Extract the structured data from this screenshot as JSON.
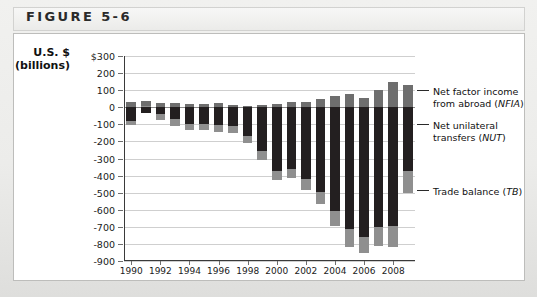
{
  "figure": {
    "label": "FIGURE 5-6"
  },
  "axis_title": {
    "line1": "U.S. $",
    "line2": "(billions)"
  },
  "legend": [
    {
      "id": "nfia",
      "line1": "Net factor income",
      "line2": "from abroad (NFIA)",
      "italic": "NFIA",
      "color": "#6e6e6e"
    },
    {
      "id": "nut",
      "line1": "Net unilateral",
      "line2": "transfers (NUT)",
      "italic": "NUT",
      "color": "#8f8f8f"
    },
    {
      "id": "tb",
      "line1": "Trade balance (TB)",
      "line2": "",
      "italic": "TB",
      "color": "#231f20"
    }
  ],
  "chart_data": {
    "type": "bar",
    "title": "FIGURE 5-6",
    "subtype": "stacked-bar",
    "xlabel": "",
    "ylabel": "U.S. $ (billions)",
    "ylim": [
      -900,
      300
    ],
    "ytick_step": 100,
    "ytick_labels": [
      "$300",
      "200",
      "100",
      "0",
      "-100",
      "-200",
      "-300",
      "-400",
      "-500",
      "-600",
      "-700",
      "-800",
      "-900"
    ],
    "ytick_values": [
      300,
      200,
      100,
      0,
      -100,
      -200,
      -300,
      -400,
      -500,
      -600,
      -700,
      -800,
      -900
    ],
    "grid": true,
    "legend_position": "right",
    "x": [
      1990,
      1991,
      1992,
      1993,
      1994,
      1995,
      1996,
      1997,
      1998,
      1999,
      2000,
      2001,
      2002,
      2003,
      2004,
      2005,
      2006,
      2007,
      2008,
      2009
    ],
    "categories": [
      "1990",
      "1991",
      "1992",
      "1993",
      "1994",
      "1995",
      "1996",
      "1997",
      "1998",
      "1999",
      "2000",
      "2001",
      "2002",
      "2003",
      "2004",
      "2005",
      "2006",
      "2007",
      "2008",
      "2009"
    ],
    "xtick_labels": [
      "1990",
      "1992",
      "1994",
      "1996",
      "1998",
      "2000",
      "2002",
      "2004",
      "2006",
      "2008"
    ],
    "series": [
      {
        "name": "Trade balance (TB)",
        "key": "tb",
        "color": "#231f20",
        "values": [
          -80,
          -31,
          -39,
          -70,
          -98,
          -96,
          -104,
          -108,
          -166,
          -259,
          -372,
          -361,
          -418,
          -494,
          -610,
          -714,
          -759,
          -700,
          -698,
          -375
        ]
      },
      {
        "name": "Net unilateral transfers (NUT)",
        "key": "nut",
        "color": "#8f8f8f",
        "values": [
          -26,
          10,
          -35,
          -37,
          -38,
          -38,
          -40,
          -40,
          -45,
          -48,
          -54,
          -52,
          -64,
          -71,
          -88,
          -105,
          -92,
          -115,
          -122,
          -125
        ]
      },
      {
        "name": "Net factor income from abroad (NFIA)",
        "key": "nfia",
        "color": "#6e6e6e",
        "values": [
          29,
          27,
          25,
          26,
          18,
          21,
          23,
          14,
          9,
          14,
          21,
          28,
          28,
          49,
          68,
          76,
          52,
          101,
          146,
          128
        ]
      }
    ]
  }
}
